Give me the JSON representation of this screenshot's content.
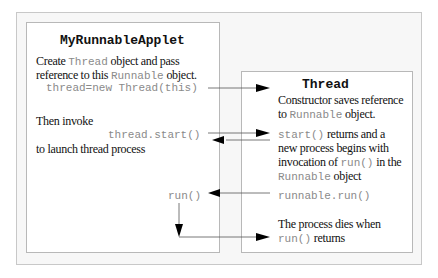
{
  "left_box": {
    "title": "MyRunnableApplet",
    "create_pre": "Create ",
    "create_code": "Thread",
    "create_post": " object and pass",
    "ref_pre": "reference to this ",
    "ref_code": "Runnable",
    "ref_post": " object.",
    "constructor_call": "thread=new Thread(this)",
    "then_invoke": "Then invoke",
    "start_call": "thread.start()",
    "launch_text": "to launch thread process",
    "run_label": "run()"
  },
  "right_box": {
    "title": "Thread",
    "ctor_line1": "Constructor saves reference",
    "ctor_pre": "to ",
    "ctor_code": "Runnable",
    "ctor_post": " object.",
    "start_code": "start()",
    "start_post": " returns and a",
    "new_process": "new process begins with",
    "invocation_pre": "invocation of ",
    "invocation_code": "run()",
    "invocation_post": " in the",
    "runnable_code": "Runnable",
    "runnable_post": " object",
    "runnable_run": "runnable.run()",
    "dies_line1": "The process dies when",
    "dies_code": "run()",
    "dies_post": " returns"
  },
  "colors": {
    "frame_bg": "#f7f7f7",
    "box_border": "#b8b8b8",
    "code_text": "#8a8a8a",
    "arrow": "#000000"
  }
}
